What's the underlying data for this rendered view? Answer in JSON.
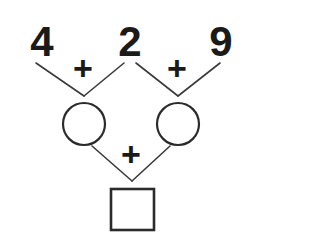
{
  "problem": {
    "type": "addition-chain-number-bond",
    "operands": [
      {
        "value": "4",
        "x": 42,
        "y": 56
      },
      {
        "value": "2",
        "x": 130,
        "y": 56
      },
      {
        "value": "9",
        "x": 221,
        "y": 56
      }
    ],
    "operators": [
      {
        "symbol": "+",
        "name": "plus-operator-left",
        "x": 83,
        "y": 71
      },
      {
        "symbol": "+",
        "name": "plus-operator-right",
        "x": 177,
        "y": 71
      },
      {
        "symbol": "+",
        "name": "plus-operator-bottom",
        "x": 131,
        "y": 157
      }
    ],
    "intermediate_slots": [
      {
        "shape": "circle",
        "value": "",
        "cx": 84,
        "cy": 124,
        "r": 21
      },
      {
        "shape": "circle",
        "value": "",
        "cx": 178,
        "cy": 124,
        "r": 21
      }
    ],
    "answer_slot": {
      "shape": "square",
      "value": "",
      "x": 111,
      "y": 189,
      "width": 43,
      "height": 41
    },
    "branches": [
      {
        "name": "branch-left-from-4",
        "points": "36,63 84,96"
      },
      {
        "name": "branch-left-from-2",
        "points": "84,96 124,63"
      },
      {
        "name": "branch-right-from-2",
        "points": "136,63 178,96"
      },
      {
        "name": "branch-right-from-9",
        "points": "178,96 220,63"
      },
      {
        "name": "branch-bottom-from-left-circle",
        "points": "92,146 132,181"
      },
      {
        "name": "branch-bottom-from-right-circle",
        "points": "132,181 170,146"
      }
    ],
    "colors": {
      "ink": "#1a1a1a",
      "line": "#3a3a3a",
      "shape_stroke": "#2b2b2b",
      "background": "#ffffff"
    }
  }
}
